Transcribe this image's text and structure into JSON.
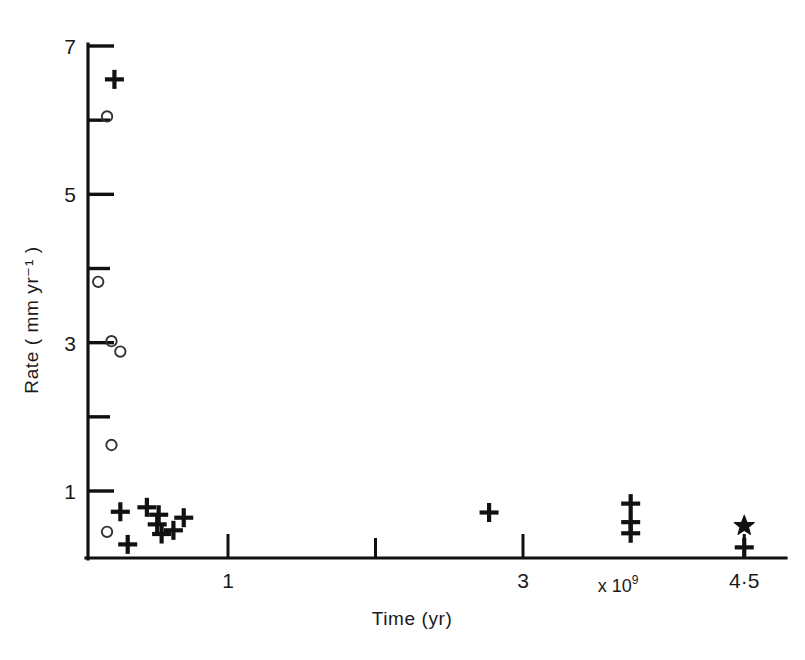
{
  "chart_data": {
    "type": "scatter",
    "title": "",
    "xlabel": "Time (yr)",
    "ylabel": "Rate ( mm yr⁻¹ )",
    "x_multiplier_note": "× 10⁹",
    "x_multiplier_base": "x 10",
    "x_multiplier_exp": "9",
    "xlim": [
      0,
      4.9
    ],
    "ylim": [
      0,
      7.35
    ],
    "grid": false,
    "legend": "none",
    "xticks": [
      {
        "value": 1,
        "label": "1",
        "major": true
      },
      {
        "value": 2,
        "label": "",
        "major": false
      },
      {
        "value": 3,
        "label": "3",
        "major": true
      },
      {
        "value": 4.5,
        "label": "4·5",
        "major": true
      }
    ],
    "yticks": [
      {
        "value": 1,
        "label": "1",
        "major": true
      },
      {
        "value": 2,
        "label": "",
        "major": false
      },
      {
        "value": 3,
        "label": "3",
        "major": true
      },
      {
        "value": 4,
        "label": "",
        "major": false
      },
      {
        "value": 5,
        "label": "5",
        "major": true
      },
      {
        "value": 6,
        "label": "",
        "major": false
      },
      {
        "value": 7,
        "label": "7",
        "major": true
      }
    ],
    "series": [
      {
        "name": "plus-markers",
        "marker": "plus",
        "points": [
          {
            "x": 0.23,
            "y": 6.55
          },
          {
            "x": 0.27,
            "y": 0.72
          },
          {
            "x": 0.45,
            "y": 0.78
          },
          {
            "x": 0.52,
            "y": 0.55
          },
          {
            "x": 0.53,
            "y": 0.68
          },
          {
            "x": 0.55,
            "y": 0.42
          },
          {
            "x": 0.63,
            "y": 0.47
          },
          {
            "x": 0.7,
            "y": 0.64
          },
          {
            "x": 0.32,
            "y": 0.28
          },
          {
            "x": 2.77,
            "y": 0.71
          },
          {
            "x": 3.73,
            "y": 0.83
          },
          {
            "x": 3.73,
            "y": 0.58
          },
          {
            "x": 3.73,
            "y": 0.43
          },
          {
            "x": 4.5,
            "y": 0.24
          }
        ]
      },
      {
        "name": "open-circle-markers",
        "marker": "circle",
        "points": [
          {
            "x": 0.18,
            "y": 6.05
          },
          {
            "x": 0.12,
            "y": 3.82
          },
          {
            "x": 0.21,
            "y": 3.02
          },
          {
            "x": 0.27,
            "y": 2.88
          },
          {
            "x": 0.21,
            "y": 1.62
          },
          {
            "x": 0.18,
            "y": 0.45
          }
        ]
      },
      {
        "name": "star-marker",
        "marker": "star",
        "points": [
          {
            "x": 4.5,
            "y": 0.53
          }
        ]
      }
    ]
  },
  "figure": {
    "caption": ""
  }
}
